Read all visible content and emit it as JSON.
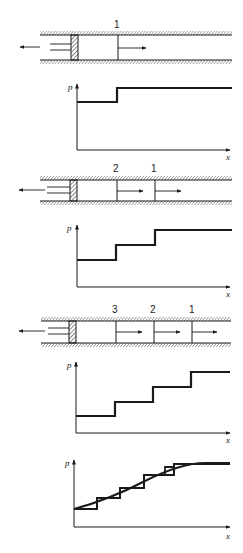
{
  "figure": {
    "colors": {
      "ink": "#1a1a1a",
      "background": "#ffffff"
    },
    "panels": [
      {
        "wave_labels": [
          "1"
        ],
        "plot": {
          "y_label": "p",
          "x_label": "x",
          "steps": 2
        }
      },
      {
        "wave_labels": [
          "2",
          "1"
        ],
        "plot": {
          "y_label": "p",
          "x_label": "x",
          "steps": 3
        }
      },
      {
        "wave_labels": [
          "3",
          "2",
          "1"
        ],
        "plot": {
          "y_label": "p",
          "x_label": "x",
          "steps": 4
        }
      }
    ],
    "final_plot": {
      "y_label": "p",
      "x_label": "x",
      "type": "stepped approximation with smooth curve"
    }
  }
}
